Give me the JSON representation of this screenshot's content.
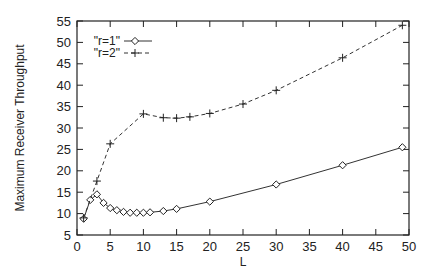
{
  "chart_data": {
    "type": "line",
    "title": "",
    "xlabel": "L",
    "ylabel": "Maximum Receiver Throughput",
    "xlim": [
      0,
      50
    ],
    "ylim": [
      5,
      55
    ],
    "xticks": [
      0,
      5,
      10,
      15,
      20,
      25,
      30,
      35,
      40,
      45,
      50
    ],
    "yticks": [
      5,
      10,
      15,
      20,
      25,
      30,
      35,
      40,
      45,
      50,
      55
    ],
    "grid": false,
    "legend_position": "top-left",
    "series": [
      {
        "name": "\"r=1\"",
        "marker": "diamond",
        "line_style": "solid",
        "x": [
          1,
          2,
          3,
          4,
          5,
          6,
          7,
          8,
          9,
          10,
          11,
          13,
          15,
          20,
          30,
          40,
          49
        ],
        "y": [
          8.8,
          13.2,
          14.5,
          12.5,
          11.3,
          10.8,
          10.4,
          10.2,
          10.2,
          10.2,
          10.3,
          10.6,
          11.1,
          12.8,
          16.8,
          21.3,
          25.5
        ]
      },
      {
        "name": "\"r=2\"",
        "marker": "plus",
        "line_style": "dashed",
        "x": [
          1,
          3,
          5,
          10,
          13,
          15,
          17,
          20,
          25,
          30,
          40,
          49
        ],
        "y": [
          9.0,
          17.6,
          26.3,
          33.3,
          32.4,
          32.3,
          32.6,
          33.4,
          35.6,
          38.8,
          46.4,
          54.0
        ]
      }
    ]
  }
}
